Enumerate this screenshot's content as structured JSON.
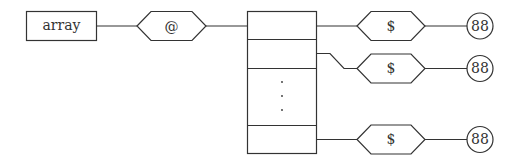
{
  "diagram": {
    "type": "data-structure",
    "root": {
      "label": "array"
    },
    "pointer": {
      "label": "@"
    },
    "stack": {
      "cells": 4,
      "ellipsis": "⋮"
    },
    "elements": [
      {
        "pointer_label": "$",
        "value": "88"
      },
      {
        "pointer_label": "$",
        "value": "88"
      },
      {
        "pointer_label": "$",
        "value": "88"
      }
    ],
    "colors": {
      "stroke": "#333333",
      "fill": "#ffffff",
      "text": "#333333"
    }
  }
}
